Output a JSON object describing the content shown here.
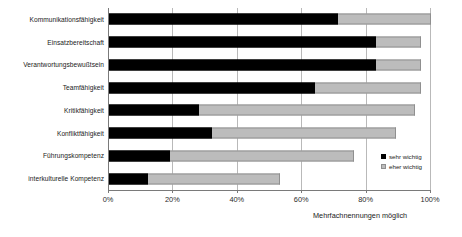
{
  "chart_data": {
    "type": "bar",
    "orientation": "horizontal",
    "stacked": true,
    "title": "",
    "xlabel": "",
    "ylabel": "",
    "xlim": [
      0,
      100
    ],
    "grid": true,
    "legend_position": "right-inside",
    "categories": [
      "Kommunikationsfähigkeit",
      "Einsatzbereitschaft",
      "Verantwortungsbewußtsein",
      "Teamfähigkeit",
      "Kritikfähigkeit",
      "Konfliktfähigkeit",
      "Führungskompetenz",
      "interkulturelle Kompetenz"
    ],
    "series": [
      {
        "name": "sehr wichtig",
        "color": "#000000",
        "values": [
          71,
          83,
          83,
          64,
          28,
          32,
          19,
          12
        ]
      },
      {
        "name": "eher wichtig",
        "color": "#bcbcbc",
        "values": [
          29,
          14,
          14,
          33,
          67,
          57,
          57,
          41
        ]
      }
    ],
    "totals": [
      100,
      97,
      97,
      97,
      95,
      89,
      76,
      53
    ],
    "tick_values": [
      0,
      20,
      40,
      60,
      80,
      100
    ],
    "tick_labels": [
      "0%",
      "20%",
      "40%",
      "60%",
      "80%",
      "100%"
    ],
    "annotation": "Mehrfachnennungen möglich"
  }
}
